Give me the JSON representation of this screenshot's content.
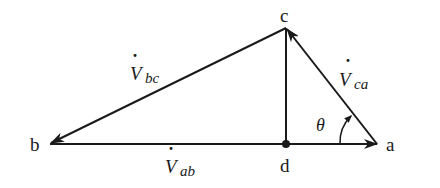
{
  "diagram": {
    "type": "phasor-triangle",
    "points": {
      "a": {
        "label": "a",
        "x": 377,
        "y": 144
      },
      "b": {
        "label": "b",
        "x": 50,
        "y": 144
      },
      "c": {
        "label": "c",
        "x": 286,
        "y": 28
      },
      "d": {
        "label": "d",
        "x": 286,
        "y": 144
      }
    },
    "vectors": [
      {
        "id": "Vab",
        "from": "d",
        "to": "a",
        "symbol": "V",
        "subscript": "ab",
        "dot": true
      },
      {
        "id": "Vbc",
        "from": "c",
        "to": "b",
        "symbol": "V",
        "subscript": "bc",
        "dot": true
      },
      {
        "id": "Vca",
        "from": "a",
        "to": "c",
        "symbol": "V",
        "subscript": "ca",
        "dot": true
      }
    ],
    "segments": [
      {
        "from": "b",
        "to": "d"
      },
      {
        "from": "c",
        "to": "d"
      }
    ],
    "angle": {
      "symbol": "θ",
      "vertex": "a"
    },
    "labels": {
      "a": "a",
      "b": "b",
      "c": "c",
      "d": "d",
      "V": "V",
      "ab": "ab",
      "bc": "bc",
      "ca": "ca",
      "dot": "·",
      "theta": "θ"
    },
    "stroke_color": "#1a1a1a"
  }
}
